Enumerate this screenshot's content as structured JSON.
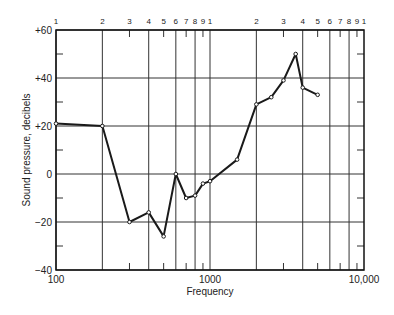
{
  "chart_data": {
    "type": "line",
    "title": "",
    "xlabel": "Frequency",
    "ylabel": "Sound pressure, decibels",
    "x_scale": "log",
    "xlim": [
      100,
      10000
    ],
    "ylim": [
      -40,
      60
    ],
    "grid": true,
    "legend": null,
    "x_tick_labels": [
      "100",
      "1000",
      "10,000"
    ],
    "x_top_labels": [
      "1",
      "2",
      "3",
      "4",
      "5",
      "6",
      "7",
      "8",
      "9",
      "1",
      "2",
      "3",
      "4",
      "5",
      "6",
      "7",
      "8",
      "9",
      "1"
    ],
    "y_tick_labels": [
      "+60",
      "+40",
      "+20",
      "0",
      "−20",
      "−40"
    ],
    "series": [
      {
        "name": "Sound pressure",
        "x": [
          100,
          200,
          300,
          400,
          500,
          600,
          700,
          800,
          900,
          1000,
          1500,
          2000,
          2500,
          3000,
          3600,
          4000,
          5000
        ],
        "y": [
          21,
          20,
          -20,
          -16,
          -26,
          0,
          -10,
          -9,
          -4,
          -3,
          6,
          29,
          32,
          39,
          50,
          36,
          33
        ]
      }
    ]
  },
  "labels": {
    "xlabel": "Frequency",
    "ylabel": "Sound pressure, decibels"
  },
  "style": {
    "line_color": "#1a1a1a",
    "grid_color": "#333333",
    "background": "#ffffff"
  }
}
